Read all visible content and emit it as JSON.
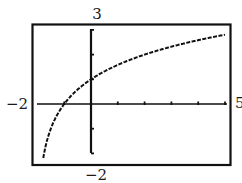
{
  "chart_data": {
    "type": "line",
    "title": "",
    "xlabel": "",
    "ylabel": "",
    "function": "y = log2(x + 2)",
    "xlim": [
      -2,
      5
    ],
    "ylim": [
      -2,
      3
    ],
    "grid": false,
    "legend": null,
    "window_labels": {
      "xmin": "−2",
      "xmax": "5",
      "ymin": "−2",
      "ymax": "3"
    },
    "x_ticks": [
      -2,
      -1,
      0,
      1,
      2,
      3,
      4,
      5
    ],
    "y_ticks": [
      -2,
      -1,
      0,
      1,
      2,
      3
    ],
    "key_points": [
      {
        "x": -1,
        "y": 0,
        "label": "x-intercept"
      },
      {
        "x": 0,
        "y": 1,
        "label": "y-intercept"
      }
    ],
    "series": [
      {
        "name": "curve",
        "x": [
          -1.8,
          -1.75,
          -1.5,
          -1.25,
          -1,
          -0.5,
          0,
          0.5,
          1,
          1.5,
          2,
          2.5,
          3,
          3.5,
          4,
          4.5,
          5
        ],
        "y": [
          -2.32,
          -2.0,
          -1.0,
          -0.415,
          0,
          0.585,
          1,
          1.32,
          1.585,
          1.807,
          2,
          2.17,
          2.32,
          2.46,
          2.585,
          2.7,
          2.807
        ]
      }
    ],
    "style": {
      "line_color": "#111111",
      "dashed": true
    }
  }
}
